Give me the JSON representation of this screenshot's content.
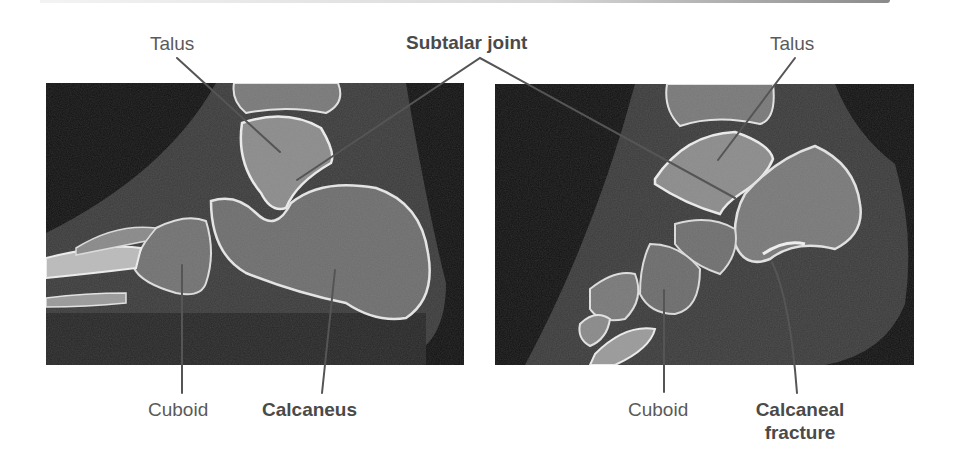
{
  "figure": {
    "panels": [
      {
        "id": "left",
        "description": "Sagittal CT of normal hindfoot",
        "labels": {
          "talus": "Talus",
          "cuboid": "Cuboid",
          "calcaneus": "Calcaneus"
        }
      },
      {
        "id": "right",
        "description": "Sagittal CT of hindfoot with calcaneal fracture",
        "labels": {
          "talus": "Talus",
          "cuboid": "Cuboid",
          "calcaneal_fracture_line1": "Calcaneal",
          "calcaneal_fracture_line2": "fracture"
        }
      }
    ],
    "shared_labels": {
      "subtalar_joint": "Subtalar joint"
    },
    "colors": {
      "background": "#ffffff",
      "label_text": "#5a5a5a",
      "bold_label_text": "#4a4a4a",
      "leader_line": "#555555",
      "ct_background": "#141414",
      "bone": "#d9d9d9"
    }
  }
}
